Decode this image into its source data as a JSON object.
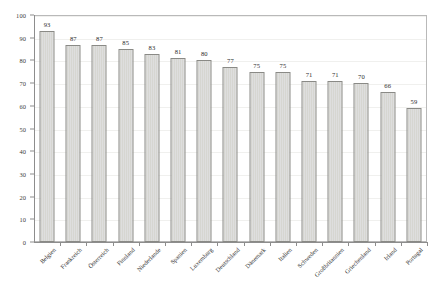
{
  "chart_data": {
    "type": "bar",
    "title": "",
    "subtitle": "",
    "xlabel": "",
    "ylabel": "",
    "ylim": [
      0,
      100
    ],
    "yticks": [
      0,
      10,
      20,
      30,
      40,
      50,
      60,
      70,
      80,
      90,
      100
    ],
    "grid": true,
    "legend": false,
    "legend_position": "none",
    "categories": [
      "Belgien",
      "Frankreich",
      "Österreich",
      "Finnland",
      "Niederlande",
      "Spanien",
      "Luxemburg",
      "Deutschland",
      "Dänemark",
      "Italien",
      "Schweden",
      "Großbritannien",
      "Griechenland",
      "Irland",
      "Portugal"
    ],
    "values": [
      93,
      87,
      87,
      85,
      83,
      81,
      80,
      77,
      75,
      75,
      71,
      71,
      70,
      66,
      59
    ],
    "data_labels": [
      "93",
      "87",
      "87",
      "85",
      "83",
      "81",
      "80",
      "77",
      "75",
      "75",
      "71",
      "71",
      "70",
      "66",
      "59"
    ],
    "ytick_labels": [
      "0",
      "10",
      "20",
      "30",
      "40",
      "50",
      "60",
      "70",
      "80",
      "90",
      "100"
    ],
    "colors": {
      "bar_fill": "#d6d6d1",
      "bar_border": "#8a8a86",
      "axis": "#8d8d8d",
      "grid": "#f0f0ee",
      "frame": "#b9b9b9",
      "text": "#2b2b2b",
      "background": "#ffffff"
    }
  }
}
